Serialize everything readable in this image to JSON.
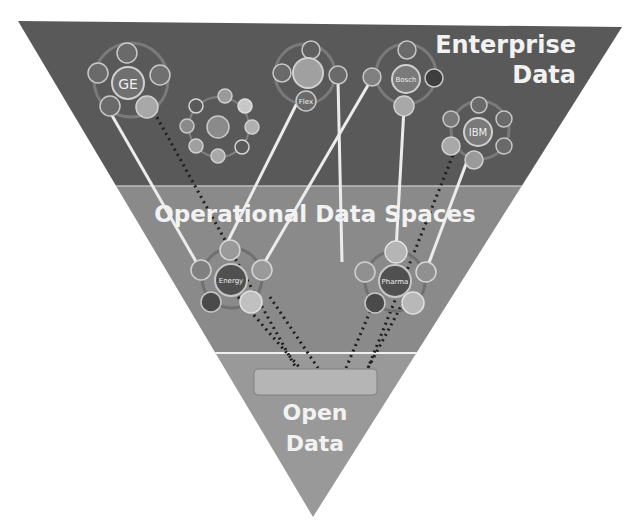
{
  "diagram": {
    "layers": [
      {
        "id": "enterprise",
        "label_line1": "Enterprise",
        "label_line2": "Data",
        "color": "#595959"
      },
      {
        "id": "operational",
        "label": "Operational Data Spaces",
        "color": "#8c8c8c"
      },
      {
        "id": "open",
        "label_line1": "Open",
        "label_line2": "Data",
        "color": "#9a9a9a"
      }
    ],
    "enterprise_clusters": [
      {
        "name": "GE",
        "center_label": "GE"
      },
      {
        "name": "Unlabeled cluster",
        "center_label": ""
      },
      {
        "name": "Siemens",
        "center_label": "Siemens",
        "satellite_label": "Flex"
      },
      {
        "name": "Bosch",
        "center_label": "Bosch"
      },
      {
        "name": "IBM",
        "center_label": "IBM"
      }
    ],
    "operational_clusters": [
      {
        "name": "Energy",
        "center_label": "Energy"
      },
      {
        "name": "Pharma",
        "center_label": "Pharma"
      }
    ],
    "open_data_bar": {
      "label": ""
    },
    "colors": {
      "enterprise_band": "#595959",
      "operational_band": "#8a8a8a",
      "open_band": "#999999",
      "link_line": "#eeeeee",
      "dotted_link": "#1e1e1e",
      "open_bar": "#b5b5b5"
    }
  }
}
